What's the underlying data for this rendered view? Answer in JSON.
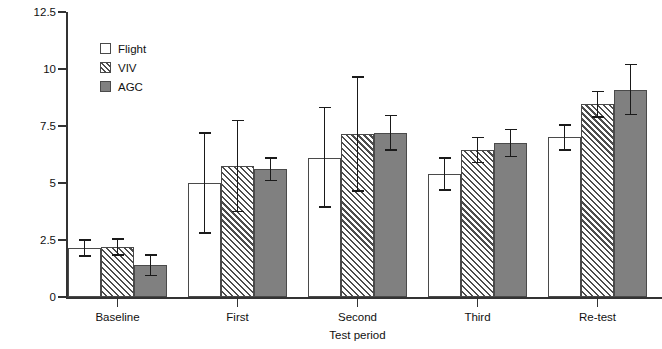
{
  "chart_data": {
    "type": "bar",
    "title": "",
    "xlabel": "Test period",
    "ylabel": "Population spike amplitude (mV)",
    "categories": [
      "Baseline",
      "First",
      "Second",
      "Third",
      "Re-test"
    ],
    "ylim": [
      0,
      12.5
    ],
    "yticks": [
      0,
      2.5,
      5,
      7.5,
      10,
      12.5
    ],
    "ytick_labels": [
      "0",
      "2.5",
      "5",
      "7.5",
      "10",
      "12.5"
    ],
    "grid": false,
    "legend_position": "top-left",
    "error_bars": "symmetric-std",
    "series": [
      {
        "name": "Flight",
        "fill": "white",
        "color": "#ffffff",
        "values": [
          2.15,
          5.0,
          6.1,
          5.4,
          7.0
        ],
        "errors_low": [
          0.35,
          2.2,
          2.15,
          0.7,
          0.55
        ],
        "errors_high": [
          0.35,
          2.2,
          2.2,
          0.7,
          0.55
        ]
      },
      {
        "name": "VIV",
        "fill": "hatched",
        "color": "#4d4d4d",
        "values": [
          2.2,
          5.75,
          7.15,
          6.45,
          8.45
        ],
        "errors_low": [
          0.35,
          2.0,
          2.5,
          0.55,
          0.55
        ],
        "errors_high": [
          0.35,
          2.0,
          2.5,
          0.55,
          0.55
        ]
      },
      {
        "name": "AGC",
        "fill": "solid",
        "color": "#808080",
        "values": [
          1.4,
          5.6,
          7.2,
          6.75,
          9.1
        ],
        "errors_low": [
          0.45,
          0.5,
          0.75,
          0.6,
          1.1
        ],
        "errors_high": [
          0.45,
          0.5,
          0.75,
          0.6,
          1.1
        ]
      }
    ]
  },
  "legend": {
    "items": [
      {
        "label": "Flight",
        "swatch": "white-square-icon"
      },
      {
        "label": "VIV",
        "swatch": "hatched-square-icon"
      },
      {
        "label": "AGC",
        "swatch": "gray-square-icon"
      }
    ]
  },
  "axes": {
    "y_title": "Population spike amplitude (mV)",
    "x_title": "Test period"
  }
}
